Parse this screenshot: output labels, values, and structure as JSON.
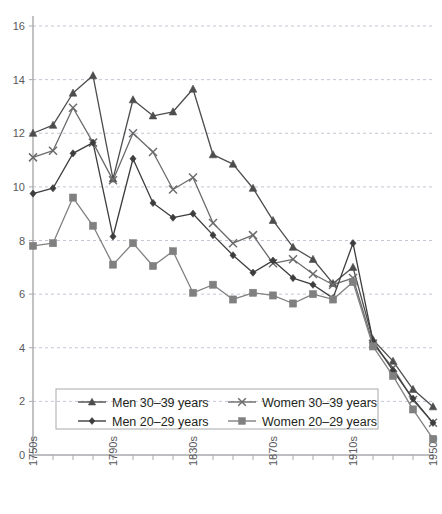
{
  "chart_data": {
    "type": "line",
    "title": "",
    "xlabel": "",
    "ylabel": "",
    "xlim_decades": [
      1750,
      1950
    ],
    "ylim": [
      0,
      16
    ],
    "ytick_step": 2,
    "grid": true,
    "grid_axis": "y",
    "legend_position": "inside-bottom-left",
    "x_tick_labels": [
      "1750s",
      "1790s",
      "1830s",
      "1870s",
      "1910s",
      "1950s"
    ],
    "x_tick_label_decades": [
      1750,
      1790,
      1830,
      1870,
      1910,
      1950
    ],
    "y_tick_labels": [
      "0",
      "2",
      "4",
      "6",
      "8",
      "10",
      "12",
      "14",
      "16"
    ],
    "x": [
      1750,
      1760,
      1770,
      1780,
      1790,
      1800,
      1810,
      1820,
      1830,
      1840,
      1850,
      1860,
      1870,
      1880,
      1890,
      1900,
      1910,
      1920,
      1930,
      1940,
      1950
    ],
    "series": [
      {
        "name": "Men 30–39 years",
        "marker": "triangle",
        "color": "#4d4d4d",
        "values": [
          12.0,
          12.3,
          13.5,
          14.15,
          10.3,
          13.25,
          12.65,
          12.8,
          13.65,
          11.2,
          10.85,
          9.95,
          8.75,
          7.75,
          7.3,
          6.4,
          7.0,
          4.3,
          3.5,
          2.45,
          1.8
        ]
      },
      {
        "name": "Women 30–39 years",
        "marker": "cross",
        "color": "#6b6b6b",
        "values": [
          11.1,
          11.35,
          12.95,
          11.65,
          10.25,
          12.0,
          11.3,
          9.9,
          10.35,
          8.65,
          7.9,
          8.2,
          7.15,
          7.3,
          6.75,
          6.35,
          6.6,
          4.15,
          3.25,
          2.05,
          1.2
        ]
      },
      {
        "name": "Men 20–29 years",
        "marker": "diamond",
        "color": "#3d3d3d",
        "values": [
          9.75,
          9.95,
          11.25,
          11.65,
          8.15,
          11.05,
          9.4,
          8.85,
          9.0,
          8.2,
          7.45,
          6.8,
          7.25,
          6.6,
          6.35,
          5.85,
          7.9,
          4.25,
          3.15,
          2.1,
          1.2
        ]
      },
      {
        "name": "Women 20–29 years",
        "marker": "square",
        "color": "#808080",
        "values": [
          7.8,
          7.9,
          9.6,
          8.55,
          7.1,
          7.9,
          7.05,
          7.6,
          6.05,
          6.35,
          5.8,
          6.05,
          5.95,
          5.65,
          6.0,
          5.8,
          6.45,
          4.05,
          2.95,
          1.7,
          0.6
        ]
      }
    ]
  },
  "legend": {
    "entries": [
      {
        "label": "Men 30–39 years",
        "marker": "triangle"
      },
      {
        "label": "Women 30–39 years",
        "marker": "cross"
      },
      {
        "label": "Men 20–29 years",
        "marker": "diamond"
      },
      {
        "label": "Women 20–29 years",
        "marker": "square"
      }
    ]
  },
  "colors": {
    "axis": "#a7a9ac",
    "grid": "#c9c3d4",
    "text": "#58595b",
    "legend_text": "#231f20",
    "legend_border": "#a7a9ac"
  }
}
